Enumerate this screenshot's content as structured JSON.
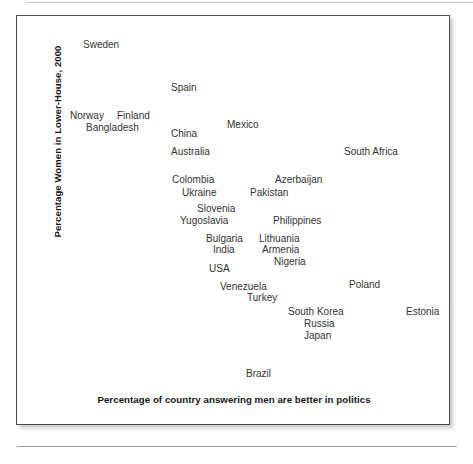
{
  "figure": {
    "y_axis_title": "Percentage Women in Lower-House, 2000",
    "x_axis_title": "Percentage of country answering men are better in politics"
  },
  "chart_data": {
    "type": "scatter",
    "title": "",
    "subtitle": "",
    "xlabel": "Percentage of country answering men are better in politics",
    "ylabel": "Percentage Women in Lower-House, 2000",
    "grid": false,
    "legend": false,
    "axis_ticks": [],
    "xlim": [
      0,
      100
    ],
    "ylim": [
      0,
      50
    ],
    "note": "Text-label scatter: each country name is plotted at its own data point; no markers, no tick labels are drawn.",
    "points": [
      {
        "label": "Sweden",
        "px": 82,
        "py": 38
      },
      {
        "label": "Spain",
        "px": 170,
        "py": 81
      },
      {
        "label": "Norway",
        "px": 69,
        "py": 109
      },
      {
        "label": "Finland",
        "px": 116,
        "py": 109
      },
      {
        "label": "Bangladesh",
        "px": 85,
        "py": 121
      },
      {
        "label": "China",
        "px": 170,
        "py": 127
      },
      {
        "label": "Mexico",
        "px": 226,
        "py": 118
      },
      {
        "label": "Australia",
        "px": 170,
        "py": 145
      },
      {
        "label": "South Africa",
        "px": 343,
        "py": 145
      },
      {
        "label": "Colombia",
        "px": 171,
        "py": 173
      },
      {
        "label": "Azerbaijan",
        "px": 274,
        "py": 173
      },
      {
        "label": "Ukraine",
        "px": 181,
        "py": 186
      },
      {
        "label": "Pakistan",
        "px": 249,
        "py": 186
      },
      {
        "label": "Slovenia",
        "px": 196,
        "py": 202
      },
      {
        "label": "Yugoslavia",
        "px": 179,
        "py": 214
      },
      {
        "label": "Philippines",
        "px": 272,
        "py": 214
      },
      {
        "label": "Bulgaria",
        "px": 205,
        "py": 232
      },
      {
        "label": "Lithuania",
        "px": 258,
        "py": 232
      },
      {
        "label": "India",
        "px": 212,
        "py": 243
      },
      {
        "label": "Armenia",
        "px": 261,
        "py": 243
      },
      {
        "label": "Nigeria",
        "px": 273,
        "py": 255
      },
      {
        "label": "USA",
        "px": 208,
        "py": 262
      },
      {
        "label": "Venezuela",
        "px": 219,
        "py": 280
      },
      {
        "label": "Poland",
        "px": 348,
        "py": 278
      },
      {
        "label": "Turkey",
        "px": 246,
        "py": 291
      },
      {
        "label": "South Korea",
        "px": 287,
        "py": 305
      },
      {
        "label": "Estonia",
        "px": 405,
        "py": 305
      },
      {
        "label": "Russia",
        "px": 303,
        "py": 317
      },
      {
        "label": "Japan",
        "px": 303,
        "py": 329
      },
      {
        "label": "Brazil",
        "px": 245,
        "py": 367
      }
    ]
  }
}
